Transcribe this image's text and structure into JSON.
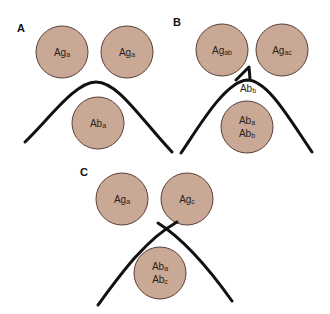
{
  "colors": {
    "well_fill": "#c9a896",
    "well_stroke": "#5a4038",
    "line": "#111111"
  },
  "panels": {
    "A": {
      "label": "A",
      "wells": [
        {
          "base": "Ag",
          "sub": "a"
        },
        {
          "base": "Ag",
          "sub": "a"
        },
        {
          "base": "Ab",
          "sub": "a"
        }
      ],
      "pattern": "identity"
    },
    "B": {
      "label": "B",
      "wells": [
        {
          "base": "Ag",
          "sub": "ab"
        },
        {
          "base": "Ag",
          "sub": "ac"
        },
        {
          "base": "Ab",
          "sub": "a",
          "base2": "Ab",
          "sub2": "b"
        }
      ],
      "spur_label": {
        "base": "Ab",
        "sub": "b"
      },
      "pattern": "partial identity (spur)"
    },
    "C": {
      "label": "C",
      "wells": [
        {
          "base": "Ag",
          "sub": "a"
        },
        {
          "base": "Ag",
          "sub": "c"
        },
        {
          "base": "Ab",
          "sub": "a",
          "base2": "Ab",
          "sub2": "c"
        }
      ],
      "pattern": "non-identity (crossing)"
    }
  }
}
